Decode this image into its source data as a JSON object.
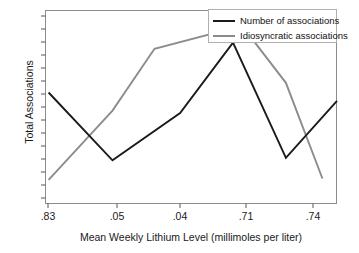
{
  "chart_data": {
    "type": "line",
    "title": "",
    "xlabel": "Mean Weekly Lithium Level (millimoles per liter)",
    "ylabel": "Total Associations",
    "categories": [
      ".83",
      ".05",
      ".04",
      ".71",
      ".74"
    ],
    "x_tick_labels": [
      ".83",
      ".05",
      ".04",
      ".71",
      ".74"
    ],
    "y_tick_labels": [],
    "grid": false,
    "legend_position": "top-right",
    "xlim": [
      0,
      8
    ],
    "ylim": [
      0,
      16
    ],
    "y_axis_labeled": false,
    "y_tick_count": 15,
    "series": [
      {
        "name": "Number of associations",
        "color": "#1a1a1a",
        "x": [
          0.1,
          1.85,
          3.7,
          5.15,
          6.6,
          8.0
        ],
        "values": [
          9.2,
          3.6,
          7.5,
          13.3,
          3.8,
          8.5
        ]
      },
      {
        "name": "Idiosyncratic associations",
        "color": "#8c8c8c",
        "x": [
          0.1,
          1.85,
          3.0,
          5.4,
          6.6,
          7.6
        ],
        "values": [
          2.0,
          7.7,
          12.8,
          14.7,
          10.0,
          2.1
        ]
      }
    ]
  },
  "legend": {
    "items": [
      {
        "label": "Number of associations",
        "color": "#1a1a1a"
      },
      {
        "label": "Idiosyncratic associations",
        "color": "#8c8c8c"
      }
    ]
  },
  "axes": {
    "x_title": "Mean Weekly Lithium Level (millimoles per liter)",
    "y_title": "Total Associations",
    "x_ticks": [
      ".83",
      ".05",
      ".04",
      ".71",
      ".74"
    ]
  }
}
